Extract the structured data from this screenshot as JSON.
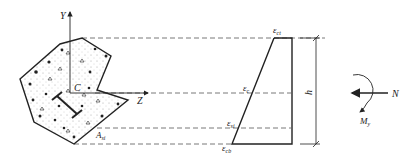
{
  "diagram": {
    "type": "section-strain-diagram",
    "section": {
      "axis_y_label": "Y",
      "axis_z_label": "Z",
      "centroid_label": "C",
      "steel_area_label": "A",
      "steel_area_sub": "si"
    },
    "strain": {
      "top_label": "ε",
      "top_sub": "ct",
      "centroid_label": "ε",
      "centroid_sub": "c",
      "steel_label": "ε",
      "steel_sub": "si",
      "bottom_label": "ε",
      "bottom_sub": "cb",
      "height_label": "h"
    },
    "loads": {
      "axial_label": "N",
      "moment_label": "M",
      "moment_sub": "y"
    },
    "colors": {
      "line": "#222222",
      "dash": "#555555",
      "fill_dots": "#888888"
    }
  }
}
